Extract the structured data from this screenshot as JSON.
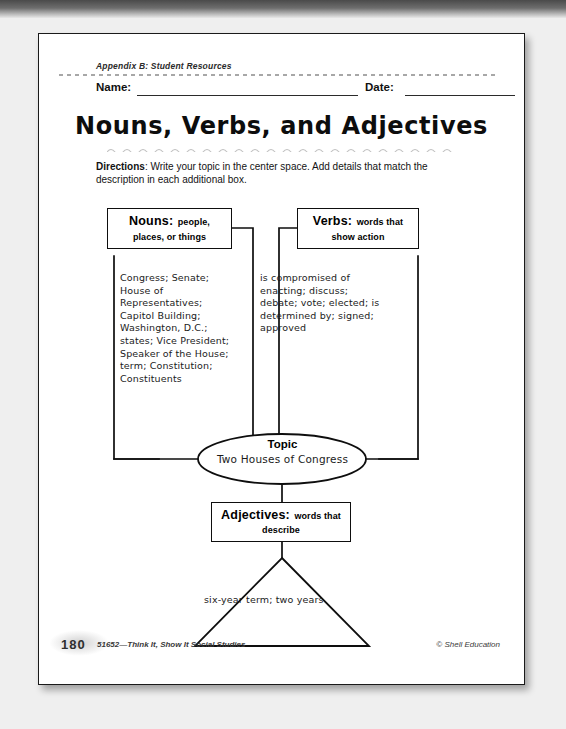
{
  "document": {
    "appendix_header": "Appendix B: Student Resources",
    "name_label": "Name:",
    "date_label": "Date:",
    "title": "Nouns, Verbs, and Adjectives",
    "directions_bold": "Directions",
    "directions_text": ": Write your topic in the center space.  Add details that match the description in each additional box."
  },
  "diagram": {
    "nouns": {
      "label_main": "Nouns:",
      "label_sub": "people, places, or things",
      "content": "Congress; Senate; House of Representatives; Capitol Building; Washington, D.C.; states; Vice President; Speaker of the House; term; Constitution; Constituents"
    },
    "verbs": {
      "label_main": "Verbs:",
      "label_sub": "words that show action",
      "content": "is compromised of enacting; discuss; debate; vote; elected; is determined by; signed; approved"
    },
    "adjectives": {
      "label_main": "Adjectives:",
      "label_sub": "words that describe",
      "content": "six-year term; two years"
    },
    "topic": {
      "label": "Topic",
      "value": "Two Houses of Congress"
    }
  },
  "footer": {
    "page_number": "180",
    "product": "51652—Think It, Show It Social Studies",
    "copyright": "© Shell Education"
  },
  "colors": {
    "ink": "#0e0e0e",
    "paper": "#ffffff",
    "scan_background": "#efefef"
  }
}
